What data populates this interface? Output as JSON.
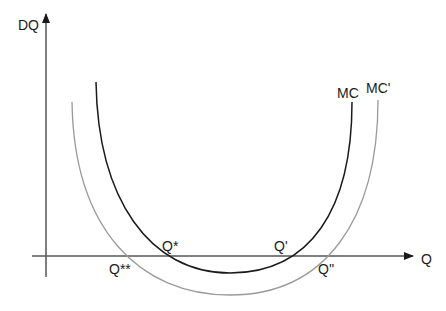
{
  "diagram": {
    "title": "",
    "axes": {
      "y_label": "DQ",
      "x_label": "Q",
      "color": "#333333"
    },
    "curves": [
      {
        "name": "MC",
        "label": "MC",
        "color": "#1a1a1a",
        "path": "M 96 82 C 98 200, 150 273, 230 273 C 310 273, 352 210, 352 102"
      },
      {
        "name": "MC'",
        "label": "MC'",
        "color": "#9a9a9a",
        "path": "M 72 102 C 74 230, 140 295, 230 295 C 325 295, 378 220, 378 100"
      }
    ],
    "intersections": [
      {
        "label": "Q*",
        "curve": "MC",
        "side": "left"
      },
      {
        "label": "Q'",
        "curve": "MC",
        "side": "right"
      },
      {
        "label": "Q**",
        "curve": "MC'",
        "side": "left"
      },
      {
        "label": "Q''",
        "curve": "MC'",
        "side": "right"
      }
    ]
  }
}
